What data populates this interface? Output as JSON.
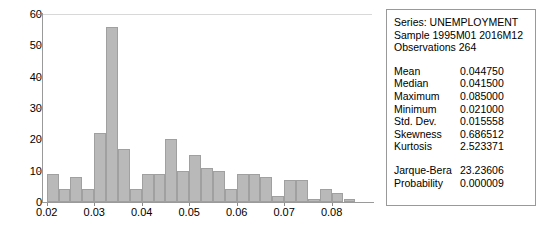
{
  "chart_data": {
    "type": "bar",
    "title": "",
    "xlabel": "",
    "ylabel": "",
    "ylim": [
      0,
      60
    ],
    "xlim": [
      0.019,
      0.0885
    ],
    "grid": false,
    "legend": "none",
    "ytick_labels": [
      "0",
      "10",
      "20",
      "30",
      "40",
      "50",
      "60"
    ],
    "ytick_values": [
      0,
      10,
      20,
      30,
      40,
      50,
      60
    ],
    "xtick_labels": [
      "0.02",
      "0.03",
      "0.04",
      "0.05",
      "0.06",
      "0.07",
      "0.08"
    ],
    "xtick_values": [
      0.02,
      0.03,
      0.04,
      0.05,
      0.06,
      0.07,
      0.08
    ],
    "bin_width": 0.0025,
    "bin_starts": [
      0.02,
      0.0225,
      0.025,
      0.0275,
      0.03,
      0.0325,
      0.035,
      0.0375,
      0.04,
      0.0425,
      0.045,
      0.0475,
      0.05,
      0.0525,
      0.055,
      0.0575,
      0.06,
      0.0625,
      0.065,
      0.0675,
      0.07,
      0.0725,
      0.075,
      0.0775,
      0.08,
      0.0825
    ],
    "categories": [
      "0.0200",
      "0.0225",
      "0.0250",
      "0.0275",
      "0.0300",
      "0.0325",
      "0.0350",
      "0.0375",
      "0.0400",
      "0.0425",
      "0.0450",
      "0.0475",
      "0.0500",
      "0.0525",
      "0.0550",
      "0.0575",
      "0.0600",
      "0.0625",
      "0.0650",
      "0.0675",
      "0.0700",
      "0.0725",
      "0.0750",
      "0.0775",
      "0.0800",
      "0.0825"
    ],
    "values": [
      9,
      4,
      8,
      4,
      22,
      56,
      17,
      4,
      9,
      9,
      20,
      10,
      15,
      11,
      10,
      4,
      9,
      9,
      8,
      2,
      7,
      7,
      1,
      4,
      3,
      1
    ],
    "bar_color": "#b9b9b9",
    "bar_border_color": "#a0a0a0"
  },
  "stats": {
    "series_line": "Series: UNEMPLOYMENT",
    "sample_line": "Sample 1995M01 2016M12",
    "observations_line": "Observations 264",
    "rows": [
      {
        "label": "Mean",
        "value": "0.044750"
      },
      {
        "label": "Median",
        "value": "0.041500"
      },
      {
        "label": "Maximum",
        "value": "0.085000"
      },
      {
        "label": "Minimum",
        "value": "0.021000"
      },
      {
        "label": "Std. Dev.",
        "value": "0.015558"
      },
      {
        "label": "Skewness",
        "value": "0.686512"
      },
      {
        "label": "Kurtosis",
        "value": "2.523371"
      }
    ],
    "test_rows": [
      {
        "label": "Jarque-Bera",
        "value": "23.23606"
      },
      {
        "label": "Probability",
        "value": "0.000009"
      }
    ]
  }
}
